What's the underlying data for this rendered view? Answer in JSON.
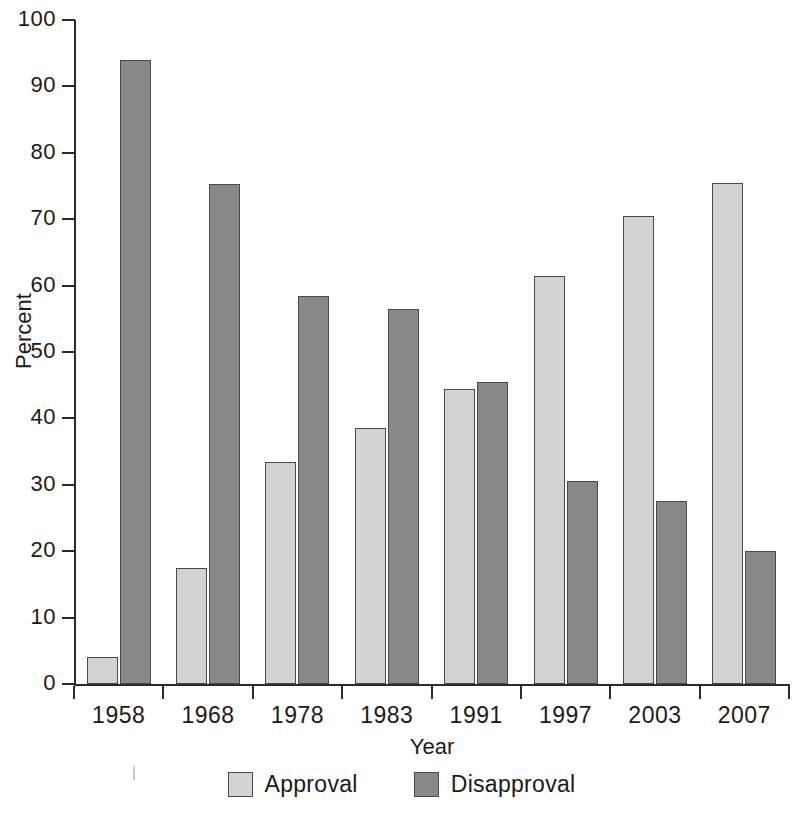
{
  "chart_data": {
    "type": "bar",
    "title": "",
    "xlabel": "Year",
    "ylabel": "Percent",
    "categories": [
      "1958",
      "1968",
      "1978",
      "1983",
      "1991",
      "1997",
      "2003",
      "2007"
    ],
    "series": [
      {
        "name": "Approval",
        "color": "#d2d2d2",
        "values": [
          4,
          17.5,
          33.5,
          38.5,
          44.5,
          61.5,
          70.5,
          75.5
        ]
      },
      {
        "name": "Disapproval",
        "color": "#888888",
        "values": [
          94,
          75.3,
          58.5,
          56.5,
          45.5,
          30.5,
          27.5,
          20
        ]
      }
    ],
    "ylim": [
      0,
      100
    ],
    "yticks": [
      0,
      10,
      20,
      30,
      40,
      50,
      60,
      70,
      80,
      90,
      100
    ],
    "ytick_labels": [
      "0",
      "10",
      "20",
      "30",
      "40",
      "50",
      "60",
      "70",
      "80",
      "90",
      "100"
    ],
    "grid": false,
    "legend_position": "bottom-center"
  },
  "legend": {
    "items": [
      {
        "label": "Approval",
        "swatch": "approval-swatch"
      },
      {
        "label": "Disapproval",
        "swatch": "disapproval-swatch"
      }
    ]
  },
  "axes": {
    "y_title": "Percent",
    "x_title": "Year"
  }
}
